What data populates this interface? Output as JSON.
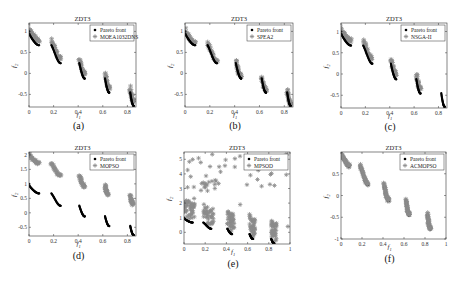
{
  "figure": {
    "panel_labels": [
      "(a)",
      "(b)",
      "(c)",
      "(d)",
      "(e)",
      "(f)"
    ]
  },
  "chart_data": [
    {
      "id": "a",
      "type": "scatter",
      "title": "ZDT3",
      "xlabel": "f1",
      "ylabel": "f2",
      "xlim": [
        0,
        0.87
      ],
      "ylim": [
        -0.8,
        1.2
      ],
      "xticks": [
        0,
        0.2,
        0.4,
        0.6,
        0.8
      ],
      "xtick_labels": [
        "0",
        "0.2",
        "0.4",
        "0.6",
        "0.8"
      ],
      "yticks": [
        -0.5,
        0,
        0.5,
        1
      ],
      "ytick_labels": [
        "-0.5",
        "0",
        "0.5",
        "1"
      ],
      "legend": [
        "Pareto front",
        "MOEA1032DNS"
      ],
      "legend_position": "upper right",
      "series": [
        {
          "name": "Pareto front",
          "marker": "dot",
          "color": "#000000",
          "offset": 0,
          "segments": "true_front"
        },
        {
          "name": "MOEA1032DNS",
          "marker": "star",
          "color": "#8c8c8c",
          "offset": 0.12,
          "segments": "true_front"
        }
      ],
      "box": {
        "left": 29,
        "top": 23,
        "right": 136,
        "bottom": 107
      }
    },
    {
      "id": "b",
      "type": "scatter",
      "title": "ZDT3",
      "xlabel": "f1",
      "ylabel": "f2",
      "xlim": [
        0,
        0.87
      ],
      "ylim": [
        -0.8,
        1.2
      ],
      "xticks": [
        0,
        0.2,
        0.4,
        0.6,
        0.8
      ],
      "xtick_labels": [
        "0",
        "0.2",
        "0.4",
        "0.6",
        "0.8"
      ],
      "yticks": [
        -0.5,
        0,
        0.5,
        1
      ],
      "ytick_labels": [
        "-0.5",
        "0",
        "0.5",
        "1"
      ],
      "legend": [
        "Pareto front",
        "SPEA2"
      ],
      "legend_position": "upper right",
      "series": [
        {
          "name": "Pareto front",
          "marker": "dot",
          "color": "#000000",
          "offset": 0,
          "segments": "true_front"
        },
        {
          "name": "SPEA2",
          "marker": "star",
          "color": "#8c8c8c",
          "offset": 0.06,
          "segments": "true_front"
        }
      ],
      "box": {
        "left": 185,
        "top": 23,
        "right": 293,
        "bottom": 107
      }
    },
    {
      "id": "c",
      "type": "scatter",
      "title": "ZDT3",
      "xlabel": "f1",
      "ylabel": "f2",
      "xlim": [
        0,
        0.87
      ],
      "ylim": [
        -0.8,
        1.2
      ],
      "xticks": [
        0,
        0.2,
        0.4,
        0.6,
        0.8
      ],
      "xtick_labels": [
        "0",
        "0.2",
        "0.4",
        "0.6",
        "0.8"
      ],
      "yticks": [
        -0.5,
        0,
        0.5,
        1
      ],
      "ytick_labels": [
        "-0.5",
        "0",
        "0.5",
        "1"
      ],
      "legend": [
        "Pareto front",
        "NSGA-II"
      ],
      "legend_position": "upper right",
      "series": [
        {
          "name": "Pareto front",
          "marker": "dot",
          "color": "#000000",
          "offset": 0,
          "segments": "true_front"
        },
        {
          "name": "NSGA-II",
          "marker": "star",
          "color": "#8c8c8c",
          "offset": 0.12,
          "segments": "first_four"
        }
      ],
      "box": {
        "left": 341,
        "top": 23,
        "right": 447,
        "bottom": 108
      }
    },
    {
      "id": "d",
      "type": "scatter",
      "title": "ZDT3",
      "xlabel": "f1",
      "ylabel": "f2",
      "xlim": [
        0,
        0.87
      ],
      "ylim": [
        -0.8,
        2.1
      ],
      "xticks": [
        0,
        0.2,
        0.4,
        0.6,
        0.8
      ],
      "xtick_labels": [
        "0",
        "0.2",
        "0.4",
        "0.6",
        "0.8"
      ],
      "yticks": [
        -0.5,
        0,
        0.5,
        1,
        1.5,
        2
      ],
      "ytick_labels": [
        "-0.5",
        "0",
        "0.5",
        "1",
        "1.5",
        "2"
      ],
      "legend": [
        "Pareto front",
        "MOPSO"
      ],
      "legend_position": "upper right",
      "series": [
        {
          "name": "Pareto front",
          "marker": "dot",
          "color": "#000000",
          "offset": 0,
          "segments": "true_front"
        },
        {
          "name": "MOPSO",
          "marker": "star",
          "color": "#8c8c8c",
          "offset": 1.05,
          "segments": "partial"
        }
      ],
      "box": {
        "left": 29,
        "top": 152,
        "right": 136,
        "bottom": 236
      }
    },
    {
      "id": "e",
      "type": "scatter",
      "title": "ZDT3",
      "xlabel": "f1",
      "ylabel": "f2",
      "xlim": [
        0,
        1
      ],
      "ylim": [
        -0.8,
        5.5
      ],
      "xticks": [
        0,
        0.2,
        0.4,
        0.6,
        0.8,
        1
      ],
      "xtick_labels": [
        "0",
        "0.2",
        "0.4",
        "0.6",
        "0.8",
        "1"
      ],
      "yticks": [
        0,
        1,
        2,
        3,
        4,
        5
      ],
      "ytick_labels": [
        "0",
        "1",
        "2",
        "3",
        "4",
        "5"
      ],
      "legend": [
        "Pareto front",
        "MPSOD"
      ],
      "legend_position": "upper right",
      "series": [
        {
          "name": "Pareto front",
          "marker": "dot",
          "color": "#000000",
          "offset": 0,
          "segments": "true_front"
        },
        {
          "name": "MPSOD",
          "marker": "star",
          "color": "#8c8c8c",
          "offset": 0.4,
          "segments": "scattered"
        }
      ],
      "box": {
        "left": 184,
        "top": 152,
        "right": 290,
        "bottom": 244
      }
    },
    {
      "id": "f",
      "type": "scatter",
      "title": "ZDT3",
      "xlabel": "f1",
      "ylabel": "f2",
      "xlim": [
        0,
        1
      ],
      "ylim": [
        -1,
        1
      ],
      "xticks": [
        0,
        0.2,
        0.4,
        0.6,
        0.8,
        1
      ],
      "xtick_labels": [
        "0",
        "0.2",
        "0.4",
        "0.6",
        "0.8",
        "1"
      ],
      "yticks": [
        -1,
        -0.5,
        0,
        0.5
      ],
      "ytick_labels": [
        "-1",
        "-0.5",
        "0",
        "0.5"
      ],
      "legend": [
        "Pareto front",
        "ACMOPSO"
      ],
      "legend_position": "upper right",
      "series": [
        {
          "name": "Pareto front",
          "marker": "dot",
          "color": "#000000",
          "offset": 0,
          "segments": "true_front"
        },
        {
          "name": "ACMOPSO",
          "marker": "star",
          "color": "#8c8c8c",
          "offset": 0.02,
          "segments": "true_front"
        }
      ],
      "box": {
        "left": 341,
        "top": 152,
        "right": 446,
        "bottom": 239
      }
    }
  ],
  "pareto_segments": [
    [
      0.0,
      0.083
    ],
    [
      0.182,
      0.258
    ],
    [
      0.409,
      0.454
    ],
    [
      0.618,
      0.653
    ],
    [
      0.823,
      0.852
    ]
  ]
}
